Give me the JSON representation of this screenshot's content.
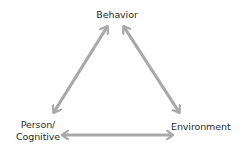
{
  "diagram": {
    "type": "triadic-reciprocal-model",
    "nodes": [
      {
        "id": "behavior",
        "label": "Behavior"
      },
      {
        "id": "person",
        "label_line1": "Person/",
        "label_line2": "Cognitive"
      },
      {
        "id": "environment",
        "label": "Environment"
      }
    ],
    "edges": [
      {
        "from": "behavior",
        "to": "person",
        "direction": "bidirectional"
      },
      {
        "from": "behavior",
        "to": "environment",
        "direction": "bidirectional"
      },
      {
        "from": "person",
        "to": "environment",
        "direction": "bidirectional"
      }
    ],
    "colors": {
      "arrow": "#a9a9a9",
      "text": "#2b2b2b",
      "background": "#ffffff"
    }
  }
}
